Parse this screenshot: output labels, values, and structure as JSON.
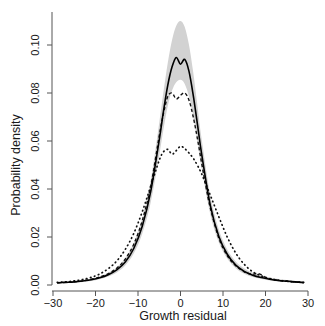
{
  "chart_data": {
    "type": "line",
    "title": "",
    "subtitle": "",
    "xlabel": "Growth residual",
    "ylabel": "Probability density",
    "xlim": [
      -30,
      30
    ],
    "ylim": [
      0,
      0.11
    ],
    "xticks": [
      -30,
      -20,
      -10,
      0,
      10,
      20,
      30
    ],
    "xticklabels": [
      "-30",
      "-20",
      "-10",
      "0",
      "10",
      "20",
      "30"
    ],
    "yticks": [
      0.0,
      0.02,
      0.04,
      0.06,
      0.08,
      0.1
    ],
    "yticklabels": [
      "0.00",
      "0.02",
      "0.04",
      "0.06",
      "0.08",
      "0.10"
    ],
    "grid": false,
    "legend": "none",
    "colors": {
      "line": "#000000",
      "ribbon": "#d2d2d2",
      "axis": "#555555",
      "text": "#1a1a1a",
      "background": "#ffffff"
    },
    "series": [
      {
        "name": "Confidence band upper",
        "style": "ribbon-upper",
        "x": [
          -29,
          -27,
          -25,
          -23,
          -21,
          -19,
          -17,
          -15,
          -13,
          -11,
          -9,
          -7,
          -5,
          -4,
          -3,
          -2,
          -1,
          0,
          1,
          2,
          3,
          4,
          5,
          7,
          9,
          11,
          13,
          15,
          17,
          19,
          21,
          23,
          25,
          27,
          29
        ],
        "values": [
          0.0012,
          0.0014,
          0.0017,
          0.0021,
          0.0027,
          0.0036,
          0.0051,
          0.0074,
          0.0112,
          0.0175,
          0.0278,
          0.0437,
          0.0676,
          0.0805,
          0.0925,
          0.102,
          0.108,
          0.11,
          0.1075,
          0.1,
          0.0885,
          0.0745,
          0.0605,
          0.0375,
          0.0232,
          0.0148,
          0.0098,
          0.0069,
          0.0051,
          0.004,
          0.0031,
          0.0025,
          0.0021,
          0.0017,
          0.0014
        ]
      },
      {
        "name": "Confidence band lower",
        "style": "ribbon-lower",
        "x": [
          -29,
          -27,
          -25,
          -23,
          -21,
          -19,
          -17,
          -15,
          -13,
          -11,
          -9,
          -7,
          -5,
          -4,
          -3,
          -2,
          -1,
          0,
          1,
          2,
          3,
          4,
          5,
          7,
          9,
          11,
          13,
          15,
          17,
          19,
          21,
          23,
          25,
          27,
          29
        ],
        "values": [
          0.0007,
          0.0008,
          0.001,
          0.0013,
          0.0017,
          0.0024,
          0.0035,
          0.0052,
          0.0081,
          0.0131,
          0.0214,
          0.0345,
          0.054,
          0.065,
          0.0745,
          0.081,
          0.0845,
          0.0855,
          0.0838,
          0.0785,
          0.07,
          0.0595,
          0.0484,
          0.0296,
          0.0178,
          0.011,
          0.007,
          0.0047,
          0.0033,
          0.0025,
          0.0019,
          0.0015,
          0.0012,
          0.001,
          0.0008
        ]
      },
      {
        "name": "Fitted distribution",
        "style": "solid",
        "x": [
          -29,
          -27,
          -25,
          -23,
          -21,
          -19,
          -17,
          -15,
          -13,
          -11,
          -9,
          -7,
          -5,
          -4,
          -3,
          -2,
          -1,
          0,
          1,
          2,
          3,
          4,
          5,
          7,
          9,
          11,
          13,
          15,
          17,
          19,
          21,
          23,
          25,
          27,
          29
        ],
        "values": [
          0.0009,
          0.0011,
          0.0013,
          0.0017,
          0.0022,
          0.003,
          0.0043,
          0.0063,
          0.0096,
          0.0152,
          0.0245,
          0.039,
          0.0605,
          0.0725,
          0.0832,
          0.0908,
          0.0948,
          0.092,
          0.094,
          0.089,
          0.079,
          0.0668,
          0.0543,
          0.0333,
          0.0203,
          0.0128,
          0.0083,
          0.0057,
          0.0041,
          0.0031,
          0.0024,
          0.0019,
          0.0016,
          0.0013,
          0.001
        ]
      },
      {
        "name": "Observed distribution (dashed)",
        "style": "dashed",
        "x": [
          -29,
          -27,
          -25,
          -23,
          -21,
          -19,
          -17,
          -15,
          -13,
          -11,
          -9,
          -7,
          -5,
          -4,
          -3,
          -2,
          -1,
          0,
          1,
          2,
          3,
          4,
          5,
          6,
          7,
          9,
          11,
          13,
          15,
          16,
          17,
          18,
          19,
          20,
          21,
          23,
          25,
          27,
          29
        ],
        "values": [
          0.0009,
          0.0011,
          0.0013,
          0.0017,
          0.0024,
          0.0033,
          0.0047,
          0.007,
          0.0108,
          0.017,
          0.0268,
          0.0412,
          0.0622,
          0.0715,
          0.0785,
          0.08,
          0.0775,
          0.079,
          0.08,
          0.077,
          0.07,
          0.0608,
          0.0505,
          0.0408,
          0.0322,
          0.0196,
          0.0122,
          0.008,
          0.0055,
          0.0048,
          0.0044,
          0.0048,
          0.0043,
          0.0032,
          0.0026,
          0.0019,
          0.0015,
          0.0012,
          0.001
        ]
      },
      {
        "name": "Alternative distribution (dotted)",
        "style": "dotted",
        "x": [
          -29,
          -27,
          -25,
          -23,
          -21,
          -19,
          -17,
          -15,
          -13,
          -11,
          -9,
          -7,
          -5,
          -4,
          -3,
          -2,
          -1,
          0,
          1,
          2,
          3,
          4,
          5,
          7,
          9,
          11,
          13,
          15,
          17,
          19,
          21,
          23,
          25,
          27,
          29
        ],
        "values": [
          0.0011,
          0.0013,
          0.0017,
          0.0023,
          0.0032,
          0.0046,
          0.0068,
          0.01,
          0.0148,
          0.0215,
          0.0305,
          0.0412,
          0.052,
          0.0555,
          0.0565,
          0.0545,
          0.056,
          0.0578,
          0.0568,
          0.055,
          0.0528,
          0.0498,
          0.0462,
          0.0375,
          0.0285,
          0.02,
          0.0133,
          0.0086,
          0.0055,
          0.0038,
          0.0027,
          0.002,
          0.0016,
          0.0013,
          0.0011
        ]
      }
    ]
  }
}
